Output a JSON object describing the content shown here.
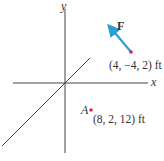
{
  "diagram": {
    "type": "3d-coordinate-force-diagram",
    "axes": {
      "x_label": "x",
      "y_label": "y"
    },
    "force": {
      "label": "F",
      "tail_coordinates": "(4, −4, 2) ft",
      "color": "#2a9fd6"
    },
    "point_A": {
      "label": "A",
      "coordinates": "(8, 2, 12) ft",
      "color": "#d6245a"
    },
    "axis_color": "#444444"
  }
}
